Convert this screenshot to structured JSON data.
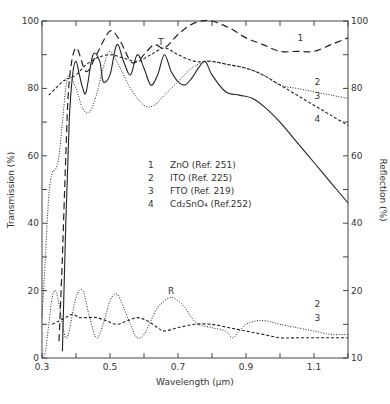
{
  "chart_data": {
    "type": "line",
    "title": "",
    "xlabel": "Wavelength (μm)",
    "ylabel_left": "Transmission (%)",
    "ylabel_right": "Reflection (%)",
    "xlim": [
      0.3,
      1.2
    ],
    "ylim": [
      0,
      100
    ],
    "x_ticks": [
      0.3,
      0.5,
      0.7,
      0.9,
      1.1
    ],
    "x_tick_labels": [
      "0.3",
      "0.5",
      "0.7",
      "0.9",
      "1.1"
    ],
    "x_minor_ticks": [
      0.4,
      0.6,
      0.8,
      1.0,
      1.2
    ],
    "y_left_ticks": [
      0,
      20,
      40,
      60,
      80,
      100
    ],
    "y_left_tick_labels": [
      "0",
      "20",
      "40",
      "60",
      "80",
      "100"
    ],
    "y_right_ticks": [
      0,
      20,
      40,
      60,
      80,
      100
    ],
    "y_right_tick_labels": [
      "10",
      "20",
      "40",
      "60",
      "80",
      "100"
    ],
    "grid": false,
    "annotations": [
      {
        "text": "T",
        "x": 0.65,
        "y": 93
      },
      {
        "text": "R",
        "x": 0.68,
        "y": 19
      },
      {
        "text": "1",
        "x": 1.06,
        "y": 94
      },
      {
        "text": "2",
        "x": 1.11,
        "y": 81
      },
      {
        "text": "3",
        "x": 1.11,
        "y": 77
      },
      {
        "text": "4",
        "x": 1.11,
        "y": 70
      },
      {
        "text": "2",
        "x": 1.11,
        "y": 15
      },
      {
        "text": "3",
        "x": 1.11,
        "y": 11
      }
    ],
    "legend": {
      "position": "center",
      "entries": [
        {
          "num": "1",
          "label": "ZnO (Ref. 251)",
          "style": "long-dash"
        },
        {
          "num": "2",
          "label": "ITO (Ref. 225)",
          "style": "dotted"
        },
        {
          "num": "3",
          "label": "FTO (Ref. 219)",
          "style": "short-dash"
        },
        {
          "num": "4",
          "label": "Cd₂SnO₄ (Ref.252)",
          "style": "solid"
        }
      ]
    },
    "series": [
      {
        "name": "1 ZnO T",
        "style": "long-dash",
        "x": [
          0.35,
          0.36,
          0.37,
          0.38,
          0.4,
          0.43,
          0.46,
          0.5,
          0.53,
          0.56,
          0.58,
          0.6,
          0.63,
          0.66,
          0.7,
          0.74,
          0.77,
          0.8,
          0.85,
          0.9,
          0.95,
          1.0,
          1.05,
          1.1,
          1.15,
          1.2
        ],
        "y": [
          5,
          30,
          60,
          82,
          92,
          85,
          90,
          97,
          94,
          88,
          88,
          90,
          93,
          92,
          96,
          99,
          100,
          100,
          98,
          95,
          93,
          91,
          91,
          91,
          93,
          95
        ]
      },
      {
        "name": "2 ITO T",
        "style": "dotted",
        "x": [
          0.3,
          0.31,
          0.32,
          0.33,
          0.34,
          0.35,
          0.36,
          0.37,
          0.38,
          0.4,
          0.42,
          0.44,
          0.46,
          0.48,
          0.5,
          0.53,
          0.56,
          0.6,
          0.63,
          0.66,
          0.7,
          0.74,
          0.78,
          0.8,
          0.85,
          0.9,
          0.95,
          1.0,
          1.05,
          1.1,
          1.15,
          1.2
        ],
        "y": [
          12,
          30,
          48,
          55,
          56,
          60,
          70,
          80,
          84,
          80,
          74,
          73,
          78,
          86,
          91,
          86,
          80,
          75,
          75,
          78,
          82,
          86,
          88,
          88,
          87,
          86,
          84,
          81,
          80,
          79,
          78,
          77
        ]
      },
      {
        "name": "3 FTO T",
        "style": "short-dash",
        "x": [
          0.32,
          0.34,
          0.36,
          0.38,
          0.4,
          0.43,
          0.46,
          0.5,
          0.54,
          0.58,
          0.62,
          0.66,
          0.7,
          0.75,
          0.8,
          0.85,
          0.9,
          0.95,
          1.0,
          1.05,
          1.1,
          1.15,
          1.2
        ],
        "y": [
          78,
          80,
          82,
          83,
          84,
          87,
          89,
          90,
          89,
          88,
          90,
          92,
          90,
          88,
          88,
          87,
          86,
          84,
          81,
          78,
          75,
          72,
          69
        ]
      },
      {
        "name": "4 Cd2SnO4 T",
        "style": "solid",
        "x": [
          0.36,
          0.37,
          0.38,
          0.39,
          0.4,
          0.41,
          0.42,
          0.43,
          0.45,
          0.47,
          0.48,
          0.5,
          0.52,
          0.54,
          0.56,
          0.58,
          0.6,
          0.62,
          0.64,
          0.66,
          0.68,
          0.7,
          0.72,
          0.74,
          0.76,
          0.78,
          0.8,
          0.84,
          0.88,
          0.92,
          0.96,
          1.0,
          1.05,
          1.1,
          1.15,
          1.2
        ],
        "y": [
          2,
          40,
          70,
          84,
          88,
          84,
          80,
          79,
          90,
          88,
          82,
          84,
          93,
          88,
          84,
          90,
          86,
          81,
          84,
          90,
          85,
          82,
          81,
          83,
          86,
          88,
          84,
          79,
          78,
          77,
          74,
          70,
          64,
          58,
          52,
          46
        ]
      },
      {
        "name": "2 ITO R",
        "style": "dotted",
        "x": [
          0.3,
          0.31,
          0.32,
          0.33,
          0.34,
          0.35,
          0.36,
          0.37,
          0.38,
          0.4,
          0.42,
          0.44,
          0.46,
          0.48,
          0.5,
          0.52,
          0.54,
          0.56,
          0.58,
          0.6,
          0.62,
          0.64,
          0.66,
          0.68,
          0.7,
          0.72,
          0.74,
          0.76,
          0.8,
          0.84,
          0.86,
          0.88,
          0.9,
          0.93,
          0.96,
          1.0,
          1.05,
          1.1,
          1.15,
          1.2
        ],
        "y": [
          0,
          2,
          10,
          18,
          20,
          16,
          10,
          6,
          8,
          18,
          20,
          12,
          6,
          10,
          17,
          19,
          15,
          10,
          6,
          7,
          11,
          15,
          17,
          18,
          17,
          15,
          12,
          10,
          9,
          8,
          6,
          8,
          10,
          11,
          11,
          10,
          9,
          8,
          7,
          7
        ]
      },
      {
        "name": "3 FTO R",
        "style": "short-dash",
        "x": [
          0.33,
          0.35,
          0.37,
          0.39,
          0.41,
          0.43,
          0.46,
          0.49,
          0.52,
          0.55,
          0.58,
          0.61,
          0.64,
          0.66,
          0.7,
          0.75,
          0.8,
          0.85,
          0.9,
          0.95,
          1.0,
          1.05,
          1.1,
          1.15,
          1.2
        ],
        "y": [
          10,
          11,
          12,
          13,
          12,
          12,
          12,
          11,
          10,
          11,
          12,
          11,
          9,
          8,
          9,
          10,
          10,
          9,
          8,
          7,
          6,
          6,
          6,
          6,
          6
        ]
      }
    ]
  }
}
